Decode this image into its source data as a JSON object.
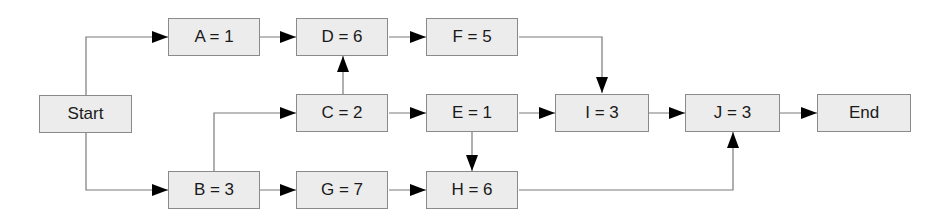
{
  "diagram": {
    "type": "activity-on-node network",
    "colors": {
      "node_fill": "#ececec",
      "node_border": "#8a8a8a",
      "edge": "#7a7a7a",
      "arrowhead": "#000000"
    },
    "nodes": {
      "start": {
        "label": "Start"
      },
      "a": {
        "label": "A = 1"
      },
      "b": {
        "label": "B = 3"
      },
      "c": {
        "label": "C = 2"
      },
      "d": {
        "label": "D = 6"
      },
      "e": {
        "label": "E = 1"
      },
      "f": {
        "label": "F = 5"
      },
      "g": {
        "label": "G = 7"
      },
      "h": {
        "label": "H = 6"
      },
      "i": {
        "label": "I = 3"
      },
      "j": {
        "label": "J = 3"
      },
      "end": {
        "label": "End"
      }
    },
    "edges": [
      [
        "Start",
        "A"
      ],
      [
        "Start",
        "B"
      ],
      [
        "A",
        "D"
      ],
      [
        "B",
        "C"
      ],
      [
        "B",
        "G"
      ],
      [
        "C",
        "D"
      ],
      [
        "C",
        "E"
      ],
      [
        "D",
        "F"
      ],
      [
        "E",
        "I"
      ],
      [
        "E",
        "H"
      ],
      [
        "F",
        "I"
      ],
      [
        "G",
        "H"
      ],
      [
        "H",
        "J"
      ],
      [
        "I",
        "J"
      ],
      [
        "J",
        "End"
      ]
    ]
  }
}
